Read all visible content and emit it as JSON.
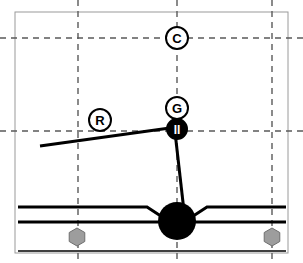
{
  "diagram": {
    "canvas": {
      "width": 303,
      "height": 263,
      "background": "#ffffff"
    },
    "frame": {
      "name": "outer-frame",
      "x": 15,
      "y": 12,
      "width": 273,
      "height": 241,
      "stroke": "#9a9a9a",
      "stroke_width": 1
    },
    "grid": {
      "style": "dashed",
      "stroke": "#5a5a5a",
      "stroke_width": 1.4,
      "dash": "6,5",
      "vertical_lines": [
        {
          "name": "grid-line-vertical-left",
          "x": 78
        },
        {
          "name": "grid-line-vertical-center",
          "x": 177
        },
        {
          "name": "grid-line-vertical-right",
          "x": 272
        }
      ],
      "horizontal_lines": [
        {
          "name": "grid-line-horizontal-top",
          "y": 38
        },
        {
          "name": "grid-line-horizontal-middle",
          "y": 131
        }
      ]
    },
    "links": [
      {
        "name": "link-arm-upper",
        "from": {
          "x": 40,
          "y": 146
        },
        "to": {
          "x": 177,
          "y": 127
        },
        "stroke": "#000000",
        "stroke_width": 3
      },
      {
        "name": "link-arm-lower",
        "from": {
          "x": 175,
          "y": 132
        },
        "to": {
          "x": 185,
          "y": 220
        },
        "stroke": "#000000",
        "stroke_width": 3
      }
    ],
    "markers": [
      {
        "name": "marker-c",
        "label": "C",
        "cx": 177,
        "cy": 38,
        "r": 11,
        "fill": "#ffffff",
        "stroke": "#000000",
        "text_color": "#000000",
        "font_size": 13
      },
      {
        "name": "marker-g",
        "label": "G",
        "cx": 177,
        "cy": 108,
        "r": 11,
        "fill": "#ffffff",
        "stroke": "#000000",
        "text_color": "#000000",
        "font_size": 13
      },
      {
        "name": "marker-r",
        "label": "R",
        "cx": 100,
        "cy": 120,
        "r": 11,
        "fill": "#ffffff",
        "stroke": "#000000",
        "text_color": "#000000",
        "font_size": 13
      },
      {
        "name": "marker-pause-joint",
        "label": "II",
        "cx": 177,
        "cy": 129,
        "r": 10,
        "fill": "#000000",
        "stroke": "#000000",
        "text_color": "#ffffff",
        "font_size": 12
      }
    ],
    "ball": {
      "name": "pivot-ball",
      "cx": 177,
      "cy": 221,
      "r": 19,
      "fill": "#000000"
    },
    "rail": {
      "name": "base-rail",
      "stroke": "#000000",
      "top_line": {
        "name": "rail-line-top",
        "y": 207,
        "x_start": 18,
        "x_end": 286,
        "stroke_width": 3,
        "notch_left_x": 147,
        "notch_right_x": 207,
        "notch_depth_y": 224
      },
      "second_line": {
        "name": "rail-line-second",
        "y": 222,
        "x_start": 18,
        "x_end": 286,
        "stroke_width": 3
      },
      "bottom_line": {
        "name": "rail-line-bottom",
        "y": 251,
        "x_start": 18,
        "x_end": 286,
        "stroke_width": 1.6
      }
    },
    "bolts": [
      {
        "name": "bolt-hexagon-left",
        "cx": 77,
        "cy": 237,
        "r": 9,
        "fill": "#9d9d9d",
        "stroke": "#6f6f6f"
      },
      {
        "name": "bolt-hexagon-right",
        "cx": 272,
        "cy": 237,
        "r": 9,
        "fill": "#9d9d9d",
        "stroke": "#6f6f6f"
      }
    ]
  }
}
